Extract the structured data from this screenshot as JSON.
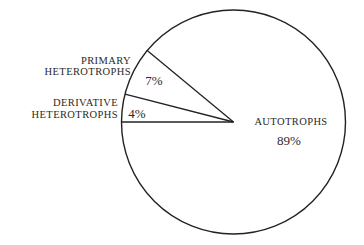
{
  "chart_data": {
    "type": "pie",
    "title": "",
    "start_angle_deg": 180,
    "direction": "clockwise-visual-up",
    "categories": [
      "Derivative Heterotrophs",
      "Primary Heterotrophs",
      "Autotrophs"
    ],
    "values": [
      4,
      7,
      89
    ],
    "units": "%",
    "slices": [
      {
        "label_lines": [
          "DERIVATIVE",
          "HETEROTROPHS"
        ],
        "value": 4,
        "value_label": "4%"
      },
      {
        "label_lines": [
          "PRIMARY",
          "HETEROTROPHS"
        ],
        "value": 7,
        "value_label": "7%"
      },
      {
        "label_lines": [
          "AUTOTROPHS"
        ],
        "value": 89,
        "value_label": "89%"
      }
    ],
    "legend": "none (labels placed beside slices)",
    "colors": {
      "stroke": "#222222",
      "fill": "#ffffff",
      "text": "#2a2a2a"
    }
  },
  "labels": {
    "primary_line1": "PRIMARY",
    "primary_line2": "HETEROTROPHS",
    "primary_pct": "7%",
    "derivative_line1": "DERIVATIVE",
    "derivative_line2": "HETEROTROPHS",
    "derivative_pct": "4%",
    "autotrophs": "AUTOTROPHS",
    "autotrophs_pct": "89%"
  }
}
